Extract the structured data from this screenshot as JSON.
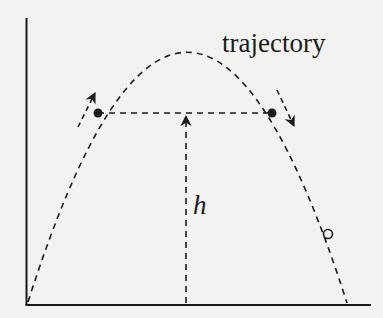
{
  "diagram": {
    "type": "projectile-trajectory",
    "labels": {
      "trajectory": "trajectory",
      "height": "h"
    },
    "colors": {
      "background": "#f2f2f1",
      "ink": "#1a1a1a"
    },
    "elements": {
      "axes": [
        "y-axis",
        "x-axis"
      ],
      "curve": "dashed parabolic trajectory from origin to ground",
      "points": [
        {
          "kind": "filled-dot",
          "side": "ascending"
        },
        {
          "kind": "filled-dot",
          "side": "descending"
        },
        {
          "kind": "open-circle",
          "side": "descending, near ground"
        }
      ],
      "arrows": [
        {
          "name": "ascending-direction",
          "direction": "up-right along curve"
        },
        {
          "name": "descending-direction",
          "direction": "down-right along curve"
        },
        {
          "name": "height-arrow",
          "direction": "vertical up from ground to horizontal line"
        }
      ],
      "horizontal_line": "dashed line joining the two filled dots at equal height"
    }
  }
}
